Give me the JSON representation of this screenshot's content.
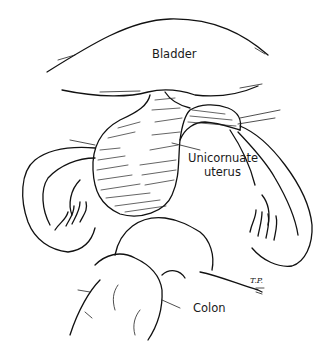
{
  "figure": {
    "type": "anatomical line illustration",
    "labels": {
      "bladder": "Bladder",
      "uterus_line1": "Unicornuate",
      "uterus_line2": "uterus",
      "colon": "Colon"
    },
    "signature": "T.P."
  }
}
